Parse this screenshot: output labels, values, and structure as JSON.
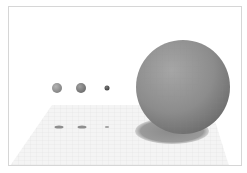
{
  "scene": {
    "background": "#ffffff",
    "frame_border": "#d6d6d6",
    "ground_plane": {
      "fill": "#f4f4f4",
      "grid_color": "#dedede",
      "points": "52,105 210,105 229,166 10,166"
    },
    "spheres": [
      {
        "name": "small-sphere-1",
        "cx": 57,
        "cy": 88,
        "r": 5,
        "color": "#9a9a9a",
        "shadow": {
          "cx": 59,
          "cy": 127,
          "rx": 4.5,
          "ry": 1.6
        }
      },
      {
        "name": "small-sphere-2",
        "cx": 81,
        "cy": 88,
        "r": 5,
        "color": "#858585",
        "shadow": {
          "cx": 82,
          "cy": 127,
          "rx": 4.5,
          "ry": 1.6
        }
      },
      {
        "name": "tiny-sphere",
        "cx": 107,
        "cy": 88,
        "r": 2.5,
        "color": "#555555",
        "shadow": {
          "cx": 107,
          "cy": 127,
          "rx": 2.2,
          "ry": 1
        }
      },
      {
        "name": "large-sphere",
        "cx": 183,
        "cy": 87,
        "r": 47,
        "color": "#8e8e8e",
        "shadow": {
          "cx": 172,
          "cy": 131,
          "rx": 37,
          "ry": 13
        }
      }
    ]
  }
}
